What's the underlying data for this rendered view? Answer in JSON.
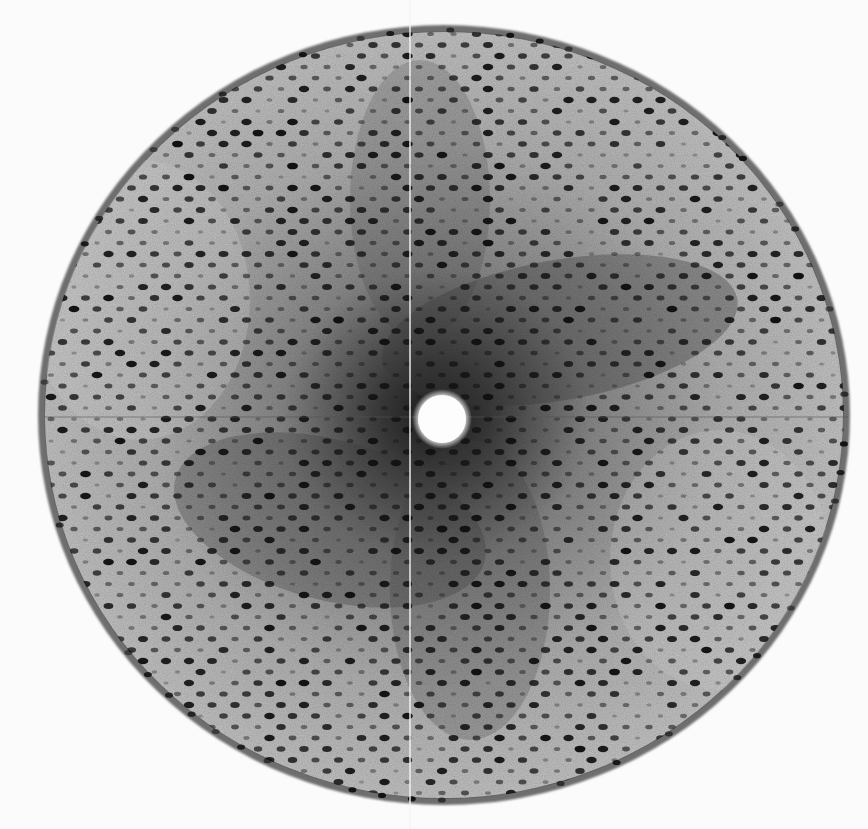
{
  "image": {
    "description": "X-ray diffraction pattern: circular detector region with lattice of dark Bragg spots, central white beamstop, faint cross lines",
    "width": 868,
    "height": 829,
    "background": "#fbfbfb"
  },
  "detector": {
    "cx": 444,
    "cy": 415,
    "rx": 406,
    "ry": 390,
    "rim_color": "#6e6e6e",
    "field_light": "#c9c9c9",
    "field_mid": "#9a9a9a",
    "field_dark": "#2a2a2a"
  },
  "beamstop": {
    "cx": 442,
    "cy": 419,
    "r": 26,
    "color": "#fdfdfd"
  },
  "cross_lines": {
    "vertical_x": 410,
    "horizontal_y": 417,
    "vertical_color": "#f2f2f2",
    "horizontal_color": "#555555"
  },
  "lattice": {
    "dx": 23,
    "dy": 11,
    "row_offset": 11.5,
    "spot_rx": 4.2,
    "spot_ry": 2.6,
    "origin_x": 442,
    "origin_y": 419,
    "spot_color": "#111111"
  }
}
